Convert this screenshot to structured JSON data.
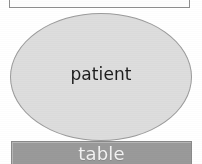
{
  "figure": {
    "background_color": "#ffffff",
    "type": "node-diagram"
  },
  "nodes": [
    {
      "id": "top-clipped-node",
      "shape": "rectangle",
      "label": "",
      "fill_color": "#fdfdfd",
      "border_color": "#8e8e8e",
      "text_color": "#1d1d1d",
      "clipped": "top"
    },
    {
      "id": "patient-node",
      "shape": "ellipse",
      "label": "patient",
      "fill_color": "#dddddd",
      "border_color": "#9b9b9b",
      "text_color": "#1d1d1d"
    },
    {
      "id": "table-node",
      "shape": "rectangle",
      "label": "table",
      "fill_color": "#9a9a9a",
      "border_color": "#8a8a8a",
      "text_color": "#f2f2f2"
    }
  ]
}
